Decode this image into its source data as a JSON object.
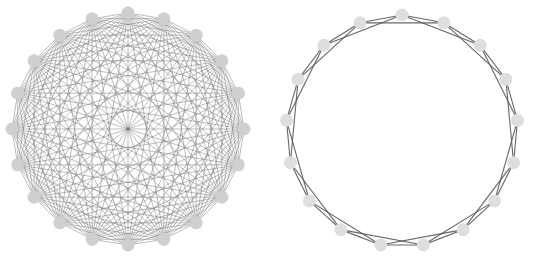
{
  "figure": {
    "width": 533,
    "height": 264,
    "background": "#ffffff"
  },
  "graphs": [
    {
      "name": "complete-graph",
      "type": "complete",
      "node_count": 20,
      "center": [
        128,
        129
      ],
      "radius": 116,
      "start_angle_deg": -90,
      "edge_color": "#6e6e6e",
      "edge_width": 0.6,
      "edge_opacity": 0.75,
      "node_color": "#cfcfcf",
      "node_radius": 6.5
    },
    {
      "name": "circulant-graph",
      "type": "circulant",
      "offsets": [
        1,
        2
      ],
      "node_count": 17,
      "center": [
        402,
        131
      ],
      "radius": 116,
      "start_angle_deg": -90,
      "edge_color": "#555555",
      "edge_width": 1.1,
      "edge_opacity": 0.9,
      "node_color": "#dedede",
      "node_radius": 6.5
    }
  ]
}
